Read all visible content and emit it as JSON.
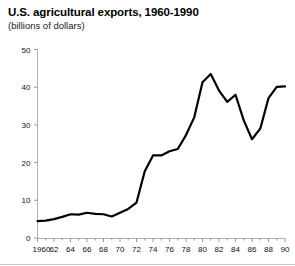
{
  "header": {
    "title": "U.S. agricultural exports, 1960-1990",
    "subtitle": "(billions of dollars)"
  },
  "chart_data": {
    "type": "line",
    "title": "U.S. agricultural exports, 1960-1990",
    "subtitle": "(billions of dollars)",
    "xlabel": "",
    "ylabel": "",
    "units": "billions of dollars",
    "xlim": [
      1960,
      1990
    ],
    "ylim": [
      0,
      50
    ],
    "yticks": [
      0,
      10,
      20,
      30,
      40,
      50
    ],
    "ytick_labels": [
      "0",
      "10",
      "20",
      "30",
      "40",
      "50"
    ],
    "xticks": [
      1960,
      1962,
      1964,
      1966,
      1968,
      1970,
      1972,
      1974,
      1976,
      1978,
      1980,
      1982,
      1984,
      1986,
      1988,
      1990
    ],
    "xtick_labels": [
      "1960",
      "62",
      "64",
      "66",
      "68",
      "70",
      "72",
      "74",
      "76",
      "78",
      "80",
      "82",
      "84",
      "86",
      "88",
      "90"
    ],
    "minor_xticks_every": 1,
    "grid": false,
    "legend": false,
    "line_color": "#000000",
    "line_width": 2.2,
    "x": [
      1960,
      1961,
      1962,
      1963,
      1964,
      1965,
      1966,
      1967,
      1968,
      1969,
      1970,
      1971,
      1972,
      1973,
      1974,
      1975,
      1976,
      1977,
      1978,
      1979,
      1980,
      1981,
      1982,
      1983,
      1984,
      1985,
      1986,
      1987,
      1988,
      1989,
      1990
    ],
    "values": [
      4.5,
      4.6,
      5.0,
      5.6,
      6.3,
      6.2,
      6.7,
      6.4,
      6.3,
      5.7,
      6.7,
      7.7,
      9.4,
      17.7,
      21.9,
      21.9,
      23.0,
      23.6,
      27.3,
      32.0,
      41.3,
      43.5,
      39.1,
      36.1,
      38.0,
      31.2,
      26.2,
      29.0,
      37.1,
      40.1,
      40.2
    ],
    "annotations": {
      "peak_year": 1981,
      "peak_value": 43.5,
      "trough_year": 1986,
      "trough_value": 26.2,
      "start_value": 4.5,
      "end_value": 40.2
    }
  }
}
